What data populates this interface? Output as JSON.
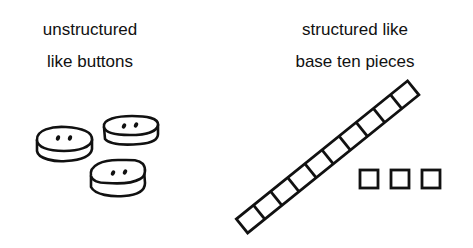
{
  "left_panel": {
    "caption_line1": "unstructured",
    "caption_line2": "like buttons",
    "items": [
      {
        "type": "button",
        "holes": 2
      },
      {
        "type": "button",
        "holes": 2
      },
      {
        "type": "button",
        "holes": 2
      }
    ]
  },
  "right_panel": {
    "caption_line1": "structured like",
    "caption_line2": "base ten pieces",
    "ten_rod": {
      "cells": 10
    },
    "unit_cubes": {
      "count": 3
    }
  },
  "colors": {
    "ink": "#111111",
    "background": "#ffffff"
  }
}
